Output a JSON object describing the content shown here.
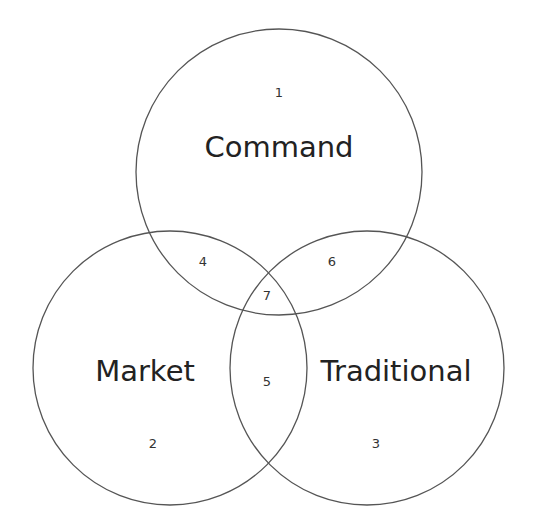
{
  "diagram": {
    "type": "venn",
    "sets": [
      {
        "name": "Command",
        "region_number": "1",
        "cx": 279,
        "cy": 172,
        "r": 143
      },
      {
        "name": "Market",
        "region_number": "2",
        "cx": 170,
        "cy": 368,
        "r": 137
      },
      {
        "name": "Traditional",
        "region_number": "3",
        "cx": 367,
        "cy": 368,
        "r": 137
      }
    ],
    "intersections": [
      {
        "sets": [
          "Command",
          "Market"
        ],
        "label": "4"
      },
      {
        "sets": [
          "Market",
          "Traditional"
        ],
        "label": "5"
      },
      {
        "sets": [
          "Command",
          "Traditional"
        ],
        "label": "6"
      },
      {
        "sets": [
          "Command",
          "Market",
          "Traditional"
        ],
        "label": "7"
      }
    ],
    "stroke_color": "#555555"
  }
}
